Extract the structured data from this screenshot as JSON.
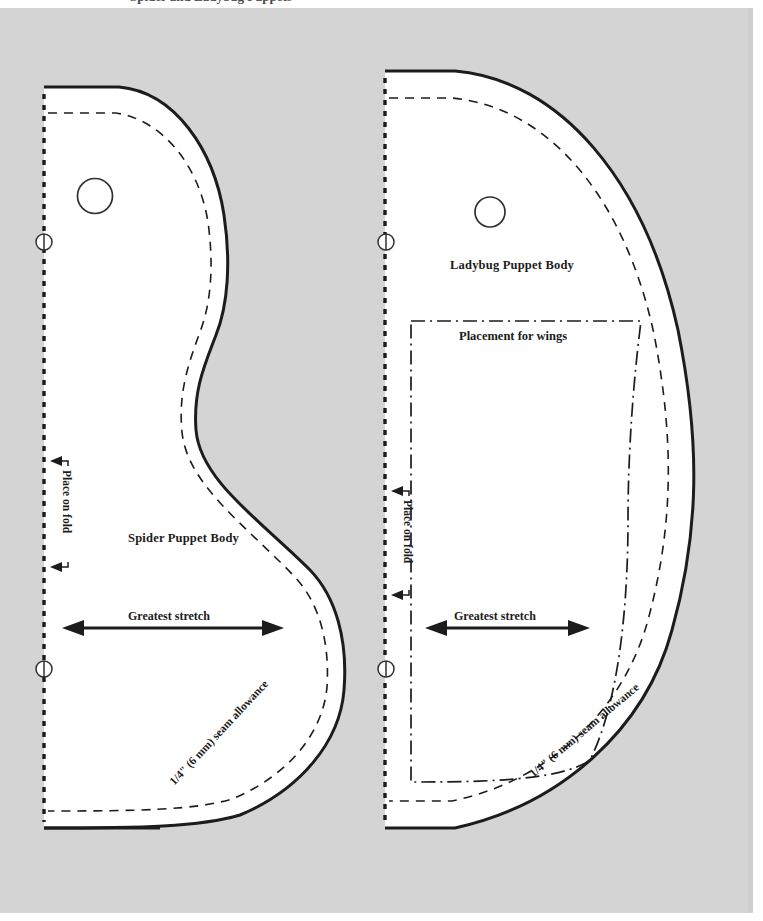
{
  "document": {
    "type": "sewing-pattern-sheet",
    "clipped_header_text": "Spider and Ladybug Puppets",
    "page_background": "#d4d4d4",
    "piece_fill": "#ffffff",
    "line_color": "#1c1c1c"
  },
  "patterns": [
    {
      "id": "spider",
      "title": "Spider Puppet Body",
      "fold_label": "Place on fold",
      "stretch_label": "Greatest stretch",
      "seam_allowance_label": "1/4\" (6 mm) seam allowance",
      "seam_allowance_fraction": {
        "numerator": "1",
        "denominator": "4",
        "unit": "\"",
        "metric": "(6 mm)",
        "tail": "seam allowance"
      },
      "markers": {
        "eye_circles": 1,
        "fold_notches": 2
      }
    },
    {
      "id": "ladybug",
      "title": "Ladybug Puppet Body",
      "fold_label": "Place on fold",
      "stretch_label": "Greatest stretch",
      "wings_label": "Placement for wings",
      "seam_allowance_label": "1/4\" (6 mm) seam allowance",
      "seam_allowance_fraction": {
        "numerator": "1",
        "denominator": "4",
        "unit": "\"",
        "metric": "(6 mm)",
        "tail": "seam allowance"
      },
      "markers": {
        "eye_circles": 1,
        "fold_notches": 2
      }
    }
  ],
  "legend": {
    "cut_line": "solid outline",
    "stitch_line": "dashed line",
    "placement_line": "dash-dot line",
    "fold_line": "dotted line"
  }
}
